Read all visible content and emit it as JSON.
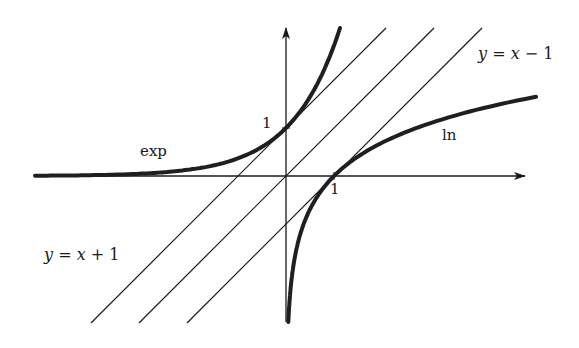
{
  "figure": {
    "colors": {
      "background": "#ffffff",
      "ink": "#1a1a1a",
      "curve": "#1f1f1f"
    },
    "geometry": {
      "origin_px": [
        286,
        176
      ],
      "unit_px": 48,
      "x_axis": {
        "from_px": 35,
        "to_px": 525
      },
      "y_axis": {
        "from_px": 322,
        "to_px": 28
      }
    },
    "curves": [
      {
        "id": "exp",
        "label": "exp",
        "function": "y = e^x",
        "passes_through": [
          0,
          1
        ]
      },
      {
        "id": "ln",
        "label": "ln",
        "function": "y = ln x",
        "passes_through": [
          1,
          0
        ]
      }
    ],
    "lines": [
      {
        "id": "y_eq_x_plus_1",
        "label_text": "y = x + 1",
        "slope": 1,
        "intercept": 1
      },
      {
        "id": "y_eq_x",
        "label_text": "",
        "slope": 1,
        "intercept": 0
      },
      {
        "id": "y_eq_x_minus_1",
        "label_text": "y = x − 1",
        "slope": 1,
        "intercept": -1
      }
    ],
    "labels": {
      "exp": "exp",
      "ln": "ln",
      "y_tick_1": "1",
      "x_tick_1": "1",
      "line_upper": {
        "lhs": "y",
        "eq": " = ",
        "rhs_var": "x",
        "op": " + ",
        "num": "1"
      },
      "line_lower": {
        "lhs": "y",
        "eq": " = ",
        "rhs_var": "x",
        "op": " − ",
        "num": "1"
      }
    }
  }
}
